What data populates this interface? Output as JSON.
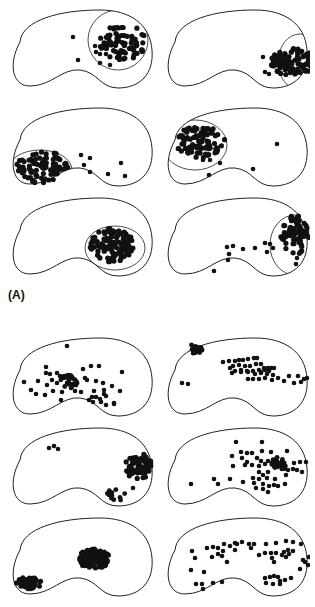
{
  "figure": {
    "label_a": "(A)",
    "colors": {
      "stroke": "#222222",
      "dot": "#111111",
      "background": "#ffffff"
    },
    "panels": [
      {
        "id": "a1",
        "x": 0,
        "y": 2,
        "field": "ellipse",
        "fieldShape": {
          "cx": 118,
          "cy": 38,
          "rx": 30,
          "ry": 30,
          "clip": "top-right"
        },
        "clusters": [
          {
            "cx": 122,
            "cy": 40,
            "rx": 24,
            "ry": 18,
            "n": 75,
            "r": 2.6
          }
        ],
        "points": [
          [
            73,
            35
          ],
          [
            78,
            58
          ],
          [
            100,
            61
          ],
          [
            110,
            63
          ],
          [
            95,
            44
          ],
          [
            96,
            50
          ],
          [
            100,
            52
          ],
          [
            106,
            52
          ]
        ]
      },
      {
        "id": "a2",
        "x": 155,
        "y": 2,
        "field": "ellipse",
        "fieldShape": {
          "cx": 145,
          "cy": 60,
          "rx": 22,
          "ry": 28
        },
        "clusters": [
          {
            "cx": 138,
            "cy": 60,
            "rx": 22,
            "ry": 14,
            "n": 90,
            "r": 2.6
          }
        ],
        "points": [
          [
            108,
            55
          ],
          [
            110,
            70
          ],
          [
            114,
            72
          ],
          [
            118,
            60
          ]
        ]
      },
      {
        "id": "b1",
        "x": 0,
        "y": 100,
        "field": "ellipse",
        "fieldShape": {
          "cx": 40,
          "cy": 70,
          "rx": 32,
          "ry": 20
        },
        "clusters": [
          {
            "cx": 42,
            "cy": 67,
            "rx": 26,
            "ry": 16,
            "n": 90,
            "r": 2.6
          }
        ],
        "points": [
          [
            81,
            55
          ],
          [
            90,
            58
          ],
          [
            84,
            65
          ],
          [
            90,
            72
          ],
          [
            108,
            74
          ],
          [
            121,
            63
          ],
          [
            125,
            76
          ]
        ]
      },
      {
        "id": "b2",
        "x": 155,
        "y": 100,
        "field": "custom",
        "fieldShape": {
          "cx": 40,
          "cy": 45,
          "rx": 32,
          "ry": 25
        },
        "clusters": [
          {
            "cx": 45,
            "cy": 42,
            "rx": 25,
            "ry": 16,
            "n": 90,
            "r": 2.6
          }
        ],
        "points": [
          [
            55,
            60
          ],
          [
            65,
            63
          ],
          [
            48,
            60
          ],
          [
            98,
            69
          ],
          [
            122,
            44
          ],
          [
            54,
            75
          ]
        ]
      },
      {
        "id": "c1",
        "x": 0,
        "y": 190,
        "field": "ellipse",
        "fieldShape": {
          "cx": 115,
          "cy": 58,
          "rx": 30,
          "ry": 22
        },
        "clusters": [
          {
            "cx": 112,
            "cy": 55,
            "rx": 22,
            "ry": 17,
            "n": 110,
            "r": 2.6
          }
        ],
        "points": []
      },
      {
        "id": "c2",
        "x": 155,
        "y": 190,
        "field": "custom",
        "fieldShape": {
          "cx": 140,
          "cy": 55,
          "rx": 25,
          "ry": 30
        },
        "clusters": [
          {
            "cx": 140,
            "cy": 45,
            "rx": 15,
            "ry": 20,
            "n": 70,
            "r": 2.6
          }
        ],
        "points": [
          [
            59,
            81
          ],
          [
            73,
            70
          ],
          [
            72,
            57
          ],
          [
            74,
            64
          ],
          [
            78,
            56
          ],
          [
            88,
            59
          ],
          [
            100,
            58
          ],
          [
            110,
            53
          ],
          [
            115,
            54
          ],
          [
            112,
            62
          ],
          [
            118,
            58
          ],
          [
            142,
            68
          ],
          [
            141,
            74
          ]
        ]
      },
      {
        "id": "d1",
        "x": 0,
        "y": 330,
        "field": "none",
        "fieldShape": null,
        "clusters": [
          {
            "cx": 69,
            "cy": 52,
            "rx": 9,
            "ry": 7,
            "n": 22,
            "r": 2.4
          }
        ],
        "points": [
          [
            67,
            16
          ],
          [
            46,
            37
          ],
          [
            24,
            52
          ],
          [
            38,
            51
          ],
          [
            31,
            60
          ],
          [
            36,
            64
          ],
          [
            45,
            65
          ],
          [
            47,
            55
          ],
          [
            53,
            61
          ],
          [
            57,
            53
          ],
          [
            60,
            46
          ],
          [
            46,
            43
          ],
          [
            57,
            43
          ],
          [
            64,
            46
          ],
          [
            62,
            62
          ],
          [
            61,
            70
          ],
          [
            75,
            61
          ],
          [
            81,
            62
          ],
          [
            85,
            48
          ],
          [
            91,
            36
          ],
          [
            99,
            36
          ],
          [
            83,
            39
          ],
          [
            87,
            50
          ],
          [
            96,
            51
          ],
          [
            94,
            61
          ],
          [
            103,
            53
          ],
          [
            112,
            56
          ],
          [
            104,
            60
          ],
          [
            104,
            64
          ],
          [
            106,
            66
          ],
          [
            100,
            69
          ],
          [
            92,
            67
          ],
          [
            89,
            70
          ],
          [
            93,
            72
          ],
          [
            96,
            67
          ],
          [
            101,
            72
          ],
          [
            106,
            75
          ],
          [
            114,
            74
          ],
          [
            120,
            61
          ],
          [
            122,
            42
          ],
          [
            114,
            73
          ],
          [
            71,
            58
          ],
          [
            67,
            53
          ],
          [
            72,
            47
          ],
          [
            50,
            44
          ],
          [
            52,
            50
          ]
        ]
      },
      {
        "id": "d2",
        "x": 155,
        "y": 330,
        "field": "none",
        "fieldShape": null,
        "clusters": [
          {
            "cx": 41,
            "cy": 18,
            "rx": 7,
            "ry": 6,
            "n": 18,
            "r": 2.4
          }
        ],
        "points": [
          [
            27,
            53
          ],
          [
            33,
            54
          ],
          [
            68,
            32
          ],
          [
            74,
            31
          ],
          [
            80,
            31
          ],
          [
            84,
            30
          ],
          [
            88,
            30
          ],
          [
            93,
            29
          ],
          [
            99,
            28
          ],
          [
            102,
            28
          ],
          [
            78,
            36
          ],
          [
            84,
            35
          ],
          [
            90,
            36
          ],
          [
            95,
            36
          ],
          [
            101,
            34
          ],
          [
            106,
            34
          ],
          [
            109,
            38
          ],
          [
            113,
            38
          ],
          [
            75,
            38
          ],
          [
            80,
            41
          ],
          [
            86,
            40
          ],
          [
            92,
            41
          ],
          [
            98,
            41
          ],
          [
            104,
            40
          ],
          [
            110,
            40
          ],
          [
            116,
            38
          ],
          [
            119,
            38
          ],
          [
            77,
            43
          ],
          [
            86,
            42
          ],
          [
            93,
            42
          ],
          [
            100,
            44
          ],
          [
            106,
            43
          ],
          [
            112,
            44
          ],
          [
            118,
            45
          ],
          [
            93,
            49
          ],
          [
            98,
            49
          ],
          [
            104,
            49
          ],
          [
            110,
            48
          ],
          [
            117,
            50
          ],
          [
            123,
            48
          ],
          [
            129,
            51
          ],
          [
            134,
            46
          ],
          [
            139,
            53
          ],
          [
            143,
            46
          ],
          [
            146,
            52
          ],
          [
            149,
            49
          ],
          [
            152,
            48
          ],
          [
            106,
            42
          ],
          [
            114,
            41
          ]
        ]
      },
      {
        "id": "e1",
        "x": 0,
        "y": 420,
        "field": "none",
        "fieldShape": null,
        "clusters": [
          {
            "cx": 138,
            "cy": 46,
            "rx": 14,
            "ry": 13,
            "n": 70,
            "r": 2.6
          },
          {
            "cx": 115,
            "cy": 74,
            "rx": 10,
            "ry": 8,
            "n": 16,
            "r": 2.4
          }
        ],
        "points": [
          [
            49,
            28
          ],
          [
            54,
            26
          ],
          [
            58,
            29
          ],
          [
            133,
            68
          ]
        ]
      },
      {
        "id": "e2",
        "x": 155,
        "y": 420,
        "field": "none",
        "fieldShape": null,
        "clusters": [
          {
            "cx": 124,
            "cy": 44,
            "rx": 8,
            "ry": 7,
            "n": 26,
            "r": 2.4
          }
        ],
        "points": [
          [
            36,
            64
          ],
          [
            59,
            59
          ],
          [
            63,
            64
          ],
          [
            75,
            59
          ],
          [
            81,
            22
          ],
          [
            107,
            22
          ],
          [
            86,
            32
          ],
          [
            92,
            33
          ],
          [
            97,
            33
          ],
          [
            107,
            31
          ],
          [
            116,
            32
          ],
          [
            132,
            31
          ],
          [
            77,
            36
          ],
          [
            87,
            38
          ],
          [
            92,
            42
          ],
          [
            102,
            38
          ],
          [
            106,
            41
          ],
          [
            113,
            41
          ],
          [
            78,
            46
          ],
          [
            90,
            45
          ],
          [
            97,
            45
          ],
          [
            104,
            46
          ],
          [
            110,
            44
          ],
          [
            139,
            43
          ],
          [
            145,
            42
          ],
          [
            151,
            42
          ],
          [
            88,
            62
          ],
          [
            98,
            58
          ],
          [
            104,
            59
          ],
          [
            108,
            55
          ],
          [
            112,
            58
          ],
          [
            120,
            59
          ],
          [
            131,
            55
          ],
          [
            133,
            50
          ],
          [
            138,
            49
          ],
          [
            142,
            50
          ],
          [
            147,
            52
          ],
          [
            101,
            68
          ],
          [
            108,
            69
          ],
          [
            113,
            72
          ],
          [
            119,
            65
          ],
          [
            123,
            66
          ],
          [
            130,
            64
          ],
          [
            113,
            52
          ],
          [
            104,
            52
          ],
          [
            99,
            63
          ],
          [
            108,
            64
          ],
          [
            114,
            66
          ]
        ]
      },
      {
        "id": "f1",
        "x": 0,
        "y": 510,
        "field": "none",
        "fieldShape": null,
        "clusters": [
          {
            "cx": 94,
            "cy": 49,
            "rx": 16,
            "ry": 10,
            "n": 110,
            "r": 2.5
          },
          {
            "cx": 29,
            "cy": 73,
            "rx": 13,
            "ry": 6,
            "n": 55,
            "r": 2.5
          }
        ],
        "points": []
      },
      {
        "id": "f2",
        "x": 155,
        "y": 510,
        "field": "none",
        "fieldShape": null,
        "clusters": [],
        "points": [
          [
            37,
            41
          ],
          [
            40,
            48
          ],
          [
            36,
            60
          ],
          [
            49,
            62
          ],
          [
            41,
            74
          ],
          [
            47,
            74
          ],
          [
            48,
            79
          ],
          [
            58,
            73
          ],
          [
            67,
            72
          ],
          [
            52,
            38
          ],
          [
            58,
            37
          ],
          [
            63,
            38
          ],
          [
            69,
            34
          ],
          [
            75,
            36
          ],
          [
            80,
            33
          ],
          [
            82,
            34
          ],
          [
            68,
            41
          ],
          [
            63,
            44
          ],
          [
            67,
            46
          ],
          [
            80,
            40
          ],
          [
            57,
            47
          ],
          [
            72,
            52
          ],
          [
            87,
            32
          ],
          [
            94,
            34
          ],
          [
            99,
            34
          ],
          [
            96,
            38
          ],
          [
            111,
            34
          ],
          [
            121,
            33
          ],
          [
            131,
            31
          ],
          [
            138,
            32
          ],
          [
            146,
            34
          ],
          [
            104,
            45
          ],
          [
            110,
            43
          ],
          [
            116,
            43
          ],
          [
            117,
            48
          ],
          [
            121,
            43
          ],
          [
            127,
            45
          ],
          [
            129,
            42
          ],
          [
            133,
            40
          ],
          [
            134,
            44
          ],
          [
            138,
            41
          ],
          [
            131,
            47
          ],
          [
            119,
            52
          ],
          [
            148,
            50
          ],
          [
            154,
            47
          ],
          [
            153,
            55
          ],
          [
            110,
            68
          ],
          [
            115,
            67
          ],
          [
            119,
            66
          ],
          [
            123,
            67
          ],
          [
            125,
            71
          ],
          [
            130,
            70
          ],
          [
            136,
            68
          ],
          [
            111,
            73
          ],
          [
            118,
            74
          ],
          [
            125,
            74
          ],
          [
            145,
            59
          ],
          [
            150,
            52
          ]
        ]
      }
    ]
  }
}
